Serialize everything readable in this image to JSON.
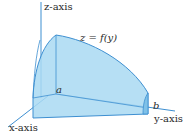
{
  "diagram": {
    "labels": {
      "z_axis": "z-axis",
      "x_axis": "x-axis",
      "y_axis": "y-axis",
      "surface": "z = f(y)",
      "a": "a",
      "b": "b"
    },
    "colors": {
      "solid_fill": "#a9d9f2",
      "solid_edge": "#3d8fd1",
      "axis": "#3d8fd1"
    }
  }
}
